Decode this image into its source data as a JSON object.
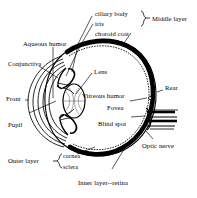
{
  "figure": {
    "type": "labeled-anatomical-diagram",
    "background_color": "#ffffff",
    "line_color": "#000000",
    "width": 197,
    "height": 198
  },
  "labels": {
    "ciliary_body": "ciliary body",
    "iris": "iris",
    "choroid_coat": "choroid coat",
    "middle_layer": "Middle layer",
    "aqueous_humor": "Aqueous humor",
    "conjunctiva": "Conjunctiva",
    "lens": "Lens",
    "vitreous_humor": "Vitreous humor",
    "front": "Front",
    "pupil": "Pupil",
    "rear": "Rear",
    "fovea": "Fovea",
    "blind_spot": "Blind spot",
    "optic_nerve": "Optic nerve",
    "outer_layer": "Outer layer",
    "cornea": "cornea",
    "sclera": "sclera",
    "inner_layer_retina": "Inner layer--retina"
  },
  "groups": {
    "middle_layer_members": [
      "ciliary body",
      "iris",
      "choroid coat"
    ],
    "outer_layer_members": [
      "cornea",
      "sclera"
    ]
  }
}
